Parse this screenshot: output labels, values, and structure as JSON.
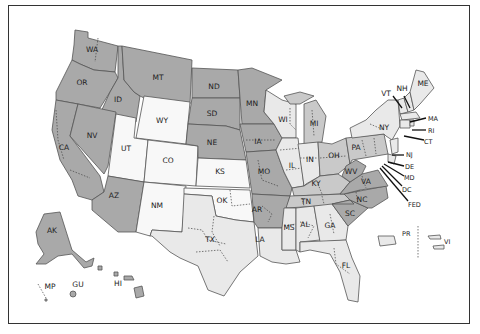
{
  "map": {
    "title": "",
    "description": "United States federal judicial districts map, states shaded in grayscale",
    "colors": {
      "dark": "#a9a9a9",
      "mid": "#c9c9c9",
      "light": "#e9e9e9",
      "white": "#f8f8f8",
      "border": "#333333"
    },
    "states": {
      "WA": "WA",
      "OR": "OR",
      "CA": "CA",
      "ID": "ID",
      "NV": "NV",
      "MT": "MT",
      "WY": "WY",
      "UT": "UT",
      "AZ": "AZ",
      "CO": "CO",
      "NM": "NM",
      "ND": "ND",
      "SD": "SD",
      "NE": "NE",
      "KS": "KS",
      "OK": "OK",
      "TX": "TX",
      "MN": "MN",
      "IA": "IA",
      "MO": "MO",
      "AR": "AR",
      "LA": "LA",
      "WI": "WI",
      "IL": "IL",
      "MI": "MI",
      "IN": "IN",
      "OH": "OH",
      "KY": "KY",
      "TN": "TN",
      "MS": "MS",
      "AL": "AL",
      "GA": "GA",
      "FL": "FL",
      "SC": "SC",
      "NC": "NC",
      "VA": "VA",
      "WV": "WV",
      "PA": "PA",
      "NY": "NY",
      "ME": "ME",
      "VT": "VT",
      "NH": "NH",
      "MA": "MA",
      "RI": "RI",
      "CT": "CT",
      "NJ": "NJ",
      "DE": "DE",
      "MD": "MD",
      "DC": "DC",
      "FED": "FED",
      "AK": "AK",
      "HI": "HI",
      "GU": "GU",
      "MP": "MP",
      "PR": "PR",
      "VI": "VI"
    }
  }
}
